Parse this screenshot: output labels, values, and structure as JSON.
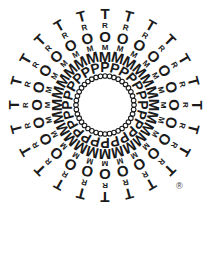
{
  "canvas": {
    "width": 219,
    "height": 264,
    "background_color": "#ffffff",
    "ink_color": "#1a1a1a"
  },
  "logo": {
    "name": "TROMMPo radial starburst wordmark",
    "word": "TROMMP",
    "letters_outward_to_inward": [
      "T",
      "R",
      "O",
      "M",
      "M",
      "P"
    ],
    "inner_ring_glyph": "o",
    "ray_count": 24,
    "ray_angle_step_degrees": 15,
    "inner_ring_dot_count": 40,
    "center": {
      "x": 105,
      "y": 105
    },
    "rings": [
      {
        "index": 0,
        "glyph": "T",
        "radius": 92,
        "font_size": 15
      },
      {
        "index": 1,
        "glyph": "R",
        "radius": 80,
        "font_size": 8
      },
      {
        "index": 2,
        "glyph": "O",
        "radius": 69,
        "font_size": 15
      },
      {
        "index": 3,
        "glyph": "M",
        "radius": 58,
        "font_size": 8
      },
      {
        "index": 4,
        "glyph": "M",
        "radius": 49,
        "font_size": 15
      },
      {
        "index": 5,
        "glyph": "P",
        "radius": 38,
        "font_size": 14
      },
      {
        "index": 6,
        "glyph": "o",
        "radius": 29,
        "font_size": 6
      }
    ]
  },
  "registered_mark": {
    "symbol": "®",
    "x": 176,
    "y": 182,
    "font_size": 9
  }
}
